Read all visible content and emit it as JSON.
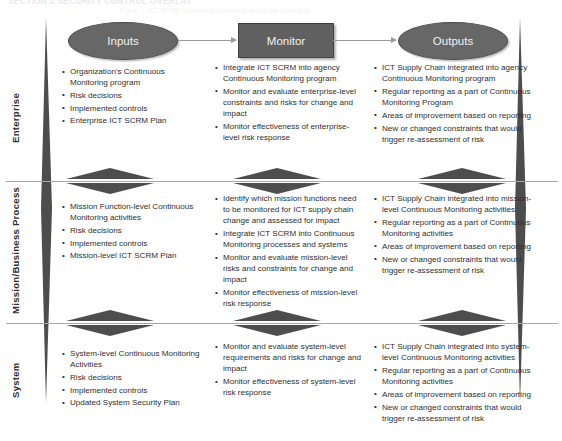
{
  "page": {
    "ghost_header": "SECTION 2       SECURITY CONTROL OVERLAY",
    "ghost_sub": "Figure  —  ICT SCRM Continuous Monitoring across the three tiers"
  },
  "colors": {
    "shape_fill": "#676767",
    "shape_fill_rect": "#606060",
    "shape_text": "#f2f2f2",
    "arrow": "#9a9a9a",
    "wedge": "#4d4d4d",
    "divider": "#a8a8a8",
    "body_text": "#2f2f2f"
  },
  "flow": {
    "inputs_label": "Inputs",
    "monitor_label": "Monitor",
    "outputs_label": "Outputs",
    "arrow_1": "arrow-inputs-to-monitor",
    "arrow_2": "arrow-monitor-to-outputs"
  },
  "tiers": [
    {
      "id": "enterprise",
      "label": "Enterprise",
      "inputs": [
        "Organization's Continuous Monitoring program",
        "Risk decisions",
        "Implemented controls",
        "Enterprise ICT SCRM Plan"
      ],
      "monitor": [
        "Integrate ICT SCRM into agency Continuous Monitoring program",
        "Monitor and evaluate enterprise-level constraints and risks for change and impact",
        "Monitor effectiveness of enterprise-level risk response"
      ],
      "outputs": [
        "ICT Supply Chain integrated into agency Continuous Monitoring program",
        "Regular reporting as a part of Continuous Monitoring Program",
        "Areas of improvement based on reporting",
        "New or changed constraints that would trigger re-assessment of risk"
      ]
    },
    {
      "id": "mission",
      "label": "Mission/Business Process",
      "inputs": [
        "Mission Function-level Continuous Monitoring activities",
        "Risk decisions",
        "Implemented controls",
        "Mission-level ICT SCRM Plan"
      ],
      "monitor": [
        "Identify which mission functions need to be monitored for ICT supply chain change and  assessed for impact",
        "Integrate ICT SCRM into Continuous Monitoring processes and systems",
        "Monitor and evaluate mission-level risks and constraints for change and impact",
        "Monitor effectiveness of mission-level risk response"
      ],
      "outputs": [
        "ICT Supply Chain integrated into mission-level Continuous Monitoring activities",
        "Regular reporting as a part of Continuous Monitoring activities",
        "Areas of improvement based on reporting",
        "New or changed constraints that would trigger re-assessment of risk"
      ]
    },
    {
      "id": "system",
      "label": "System",
      "inputs": [
        "System-level Continuous Monitoring Activities",
        "Risk decisions",
        "Implemented controls",
        "Updated System Security Plan"
      ],
      "monitor": [
        "Monitor and evaluate system-level requirements and risks for change and impact",
        "Monitor effectiveness of system-level risk response"
      ],
      "outputs": [
        "ICT Supply Chain integrated into system-level Continuous Monitoring activities",
        "Regular reporting as a part of Continuous Monitoring activities",
        "Areas of improvement based on reporting",
        "New or changed constraints that would trigger re-assessment of risk"
      ]
    }
  ]
}
